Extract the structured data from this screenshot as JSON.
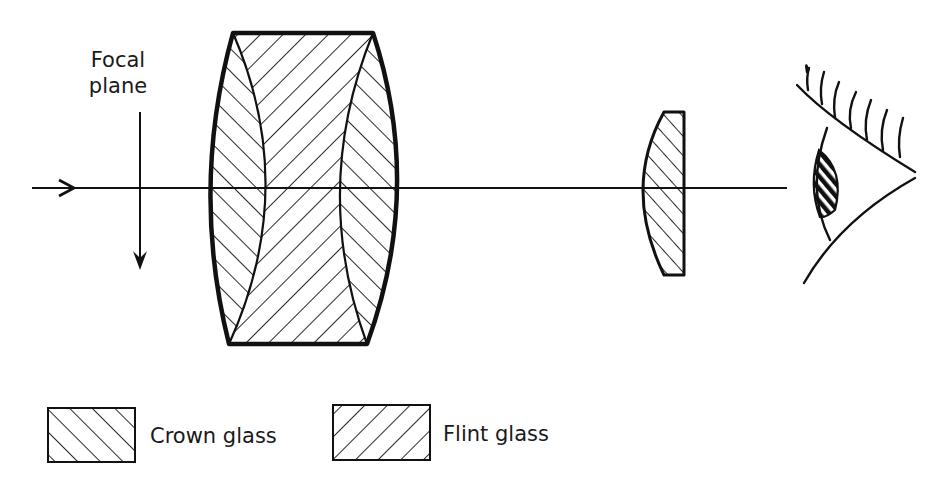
{
  "diagram": {
    "title": "",
    "annotations": {
      "focal_plane_line1": "Focal",
      "focal_plane_line2": "plane"
    },
    "components": [
      {
        "id": "incoming-ray-arrow",
        "type": "arrow",
        "direction": "right"
      },
      {
        "id": "focal-plane-arrow",
        "type": "arrow",
        "direction": "down"
      },
      {
        "id": "objective-lens",
        "type": "compound-lens",
        "elements": [
          "crown",
          "flint",
          "crown"
        ]
      },
      {
        "id": "eye-lens",
        "type": "plano-convex-lens",
        "material": "crown"
      },
      {
        "id": "eye",
        "type": "observer-eye"
      }
    ],
    "optical_axis": "horizontal"
  },
  "legend": {
    "items": [
      {
        "label": "Crown glass",
        "hatch": "forward-slash"
      },
      {
        "label": "Flint glass",
        "hatch": "back-slash"
      }
    ]
  },
  "colors": {
    "ink": "#111111",
    "background": "#ffffff"
  }
}
